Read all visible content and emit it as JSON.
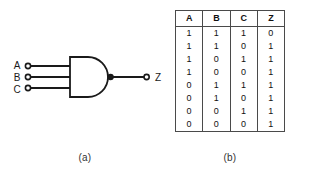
{
  "figure": {
    "gate": {
      "type": "nand-gate",
      "input_labels": [
        "A",
        "B",
        "C"
      ],
      "output_label": "Z",
      "input_count": 3,
      "has_inversion_bubble": true,
      "line_color": "#1a1a1a"
    },
    "caption_a": "(a)",
    "caption_b": "(b)"
  },
  "truth_table": {
    "headers": [
      "A",
      "B",
      "C",
      "Z"
    ],
    "rows": [
      [
        "1",
        "1",
        "1",
        "0"
      ],
      [
        "1",
        "1",
        "0",
        "1"
      ],
      [
        "1",
        "0",
        "1",
        "1"
      ],
      [
        "1",
        "0",
        "0",
        "1"
      ],
      [
        "0",
        "1",
        "1",
        "1"
      ],
      [
        "0",
        "1",
        "0",
        "1"
      ],
      [
        "0",
        "0",
        "1",
        "1"
      ],
      [
        "0",
        "0",
        "0",
        "1"
      ]
    ]
  }
}
